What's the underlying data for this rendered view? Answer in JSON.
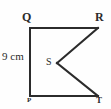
{
  "figure": {
    "type": "geometry-diagram",
    "background_color": "#fefefe",
    "stroke_color": "#2b2b2b",
    "stroke_width": 2,
    "label_color": "#2b2b2b",
    "width": 111,
    "height": 109,
    "vertices": [
      {
        "id": "Q",
        "label": "Q",
        "x": 30,
        "y": 28,
        "label_x": 22,
        "label_y": 11
      },
      {
        "id": "R",
        "label": "R",
        "x": 98,
        "y": 28,
        "label_x": 95,
        "label_y": 11
      },
      {
        "id": "S",
        "label": "S",
        "x": 57,
        "y": 63,
        "label_x": 46,
        "label_y": 57
      },
      {
        "id": "P",
        "label": "P",
        "x": 30,
        "y": 96,
        "label_x": 27,
        "label_y": 97
      },
      {
        "id": "T",
        "label": "T",
        "x": 98,
        "y": 96,
        "label_x": 96,
        "label_y": 96
      }
    ],
    "edges": [
      {
        "name": "edge-QR",
        "from": "Q",
        "to": "R",
        "points": "30,28 98,28"
      },
      {
        "name": "edge-QP",
        "from": "Q",
        "to": "P",
        "points": "30,28 30,96"
      },
      {
        "name": "edge-PT",
        "from": "P",
        "to": "T",
        "points": "30,96 98,96"
      },
      {
        "name": "edge-RS",
        "from": "R",
        "to": "S",
        "points": "98,28 57,63"
      },
      {
        "name": "edge-ST",
        "from": "S",
        "to": "T",
        "points": "57,63 98,96"
      }
    ],
    "measurements": [
      {
        "name": "side-QP-length",
        "text": "9 cm",
        "applies_to": "QP",
        "x": 2,
        "y": 51
      }
    ]
  }
}
